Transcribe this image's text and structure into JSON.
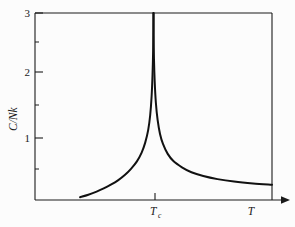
{
  "figure": {
    "background_color": "#fcfcfc",
    "ink_color": "#111111",
    "ylabel": "C/Nk",
    "ylabel_parts": {
      "numerator": "C",
      "slash": "/",
      "denominator": "Nk"
    },
    "xlabel": "T",
    "critical_label_main": "T",
    "critical_label_sub": "c",
    "critical_label_full": "Tc"
  },
  "chart_data": {
    "type": "line",
    "title": "",
    "subtitle": "",
    "xlabel": "T",
    "ylabel": "C/Nk",
    "grid": false,
    "legend": false,
    "legend_position": "none",
    "annotations": [
      {
        "text": "Tc",
        "axis": "x",
        "value": 1.0,
        "note": "critical temperature tick on x-axis"
      }
    ],
    "xlim": [
      0.0,
      2.0
    ],
    "ylim": [
      0.0,
      3.0
    ],
    "ytick_values": [
      1,
      2,
      3
    ],
    "ytick_labels": [
      "1",
      "2",
      "3"
    ],
    "yminor_tick_values": [
      0.5,
      1.5,
      2.5
    ],
    "xtick_values": [
      1.0
    ],
    "xtick_labels": [
      "Tc"
    ],
    "series": [
      {
        "name": "C/Nk below Tc",
        "branch": "left",
        "x": [
          0.38,
          0.45,
          0.52,
          0.58,
          0.64,
          0.7,
          0.76,
          0.81,
          0.86,
          0.9,
          0.93,
          0.955,
          0.972,
          0.984,
          0.992,
          0.997,
          0.999,
          1.0
        ],
        "y": [
          0.045,
          0.085,
          0.135,
          0.185,
          0.245,
          0.315,
          0.405,
          0.5,
          0.62,
          0.76,
          0.92,
          1.12,
          1.36,
          1.66,
          2.02,
          2.4,
          2.72,
          3.0
        ]
      },
      {
        "name": "C/Nk above Tc",
        "branch": "right",
        "x": [
          1.0,
          1.001,
          1.004,
          1.01,
          1.02,
          1.035,
          1.055,
          1.08,
          1.12,
          1.17,
          1.24,
          1.32,
          1.42,
          1.54,
          1.68,
          1.84,
          2.0
        ],
        "y": [
          3.0,
          2.64,
          2.26,
          1.9,
          1.56,
          1.28,
          1.06,
          0.9,
          0.74,
          0.62,
          0.525,
          0.445,
          0.385,
          0.335,
          0.295,
          0.265,
          0.245
        ]
      }
    ]
  }
}
